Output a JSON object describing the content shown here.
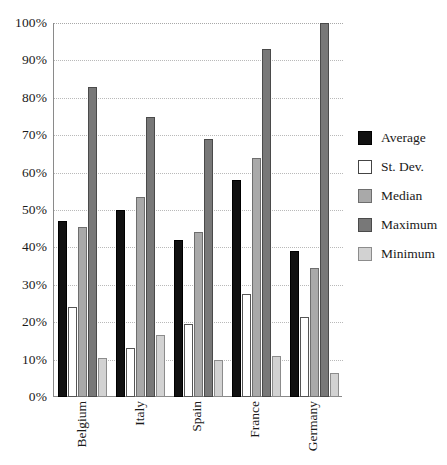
{
  "chart_data": {
    "type": "bar",
    "title": "",
    "xlabel": "",
    "ylabel": "",
    "grid": true,
    "legend_position": "right",
    "ylim": [
      0,
      100
    ],
    "yticks": [
      "0%",
      "10%",
      "20%",
      "30%",
      "40%",
      "50%",
      "60%",
      "70%",
      "80%",
      "90%",
      "100%"
    ],
    "ytick_values": [
      0,
      10,
      20,
      30,
      40,
      50,
      60,
      70,
      80,
      90,
      100
    ],
    "categories": [
      "Belgium",
      "Italy",
      "Spain",
      "France",
      "Germany"
    ],
    "series": [
      {
        "name": "Average",
        "color": "#111111",
        "values": [
          47.0,
          50.0,
          42.0,
          58.0,
          39.0
        ]
      },
      {
        "name": "St. Dev.",
        "color": "#ffffff",
        "values": [
          24.0,
          13.0,
          19.5,
          27.5,
          21.5
        ]
      },
      {
        "name": "Median",
        "color": "#a9a9a9",
        "values": [
          45.5,
          53.5,
          44.0,
          64.0,
          34.5
        ]
      },
      {
        "name": "Maximum",
        "color": "#787878",
        "values": [
          83.0,
          75.0,
          69.0,
          93.0,
          100.0
        ]
      },
      {
        "name": "Minimum",
        "color": "#d2d2d2",
        "values": [
          10.5,
          16.5,
          10.0,
          11.0,
          6.5
        ]
      }
    ]
  }
}
